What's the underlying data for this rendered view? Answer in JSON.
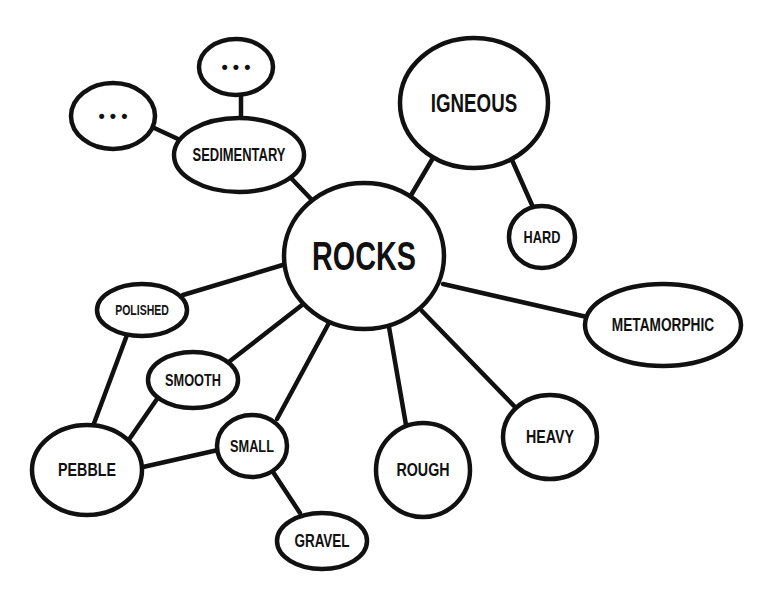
{
  "diagram": {
    "type": "mind-map",
    "colors": {
      "stroke": "#111111",
      "fill": "#ffffff",
      "text": "#111111"
    },
    "nodes": [
      {
        "id": "rocks",
        "label": "ROCKS",
        "cx": 364,
        "cy": 256,
        "rx": 80,
        "ry": 73,
        "font": 40,
        "scaleX": 0.72
      },
      {
        "id": "igneous",
        "label": "IGNEOUS",
        "cx": 474,
        "cy": 103,
        "rx": 74,
        "ry": 65,
        "font": 26,
        "scaleX": 0.72
      },
      {
        "id": "hard",
        "label": "HARD",
        "cx": 542,
        "cy": 237,
        "rx": 33,
        "ry": 31,
        "font": 17,
        "scaleX": 0.75
      },
      {
        "id": "sedimentary",
        "label": "SEDIMENTARY",
        "cx": 239,
        "cy": 155,
        "rx": 65,
        "ry": 37,
        "font": 18,
        "scaleX": 0.72
      },
      {
        "id": "dots-top",
        "label": "• • •",
        "cx": 236,
        "cy": 67,
        "rx": 37,
        "ry": 28,
        "font": 18,
        "scaleX": 1
      },
      {
        "id": "dots-left",
        "label": "• • •",
        "cx": 113,
        "cy": 116,
        "rx": 42,
        "ry": 33,
        "font": 18,
        "scaleX": 1
      },
      {
        "id": "metamorphic",
        "label": "METAMORPHIC",
        "cx": 663,
        "cy": 325,
        "rx": 78,
        "ry": 41,
        "font": 19,
        "scaleX": 0.72
      },
      {
        "id": "heavy",
        "label": "HEAVY",
        "cx": 550,
        "cy": 437,
        "rx": 47,
        "ry": 42,
        "font": 19,
        "scaleX": 0.75
      },
      {
        "id": "rough",
        "label": "ROUGH",
        "cx": 423,
        "cy": 470,
        "rx": 47,
        "ry": 47,
        "font": 19,
        "scaleX": 0.75
      },
      {
        "id": "polished",
        "label": "POLISHED",
        "cx": 142,
        "cy": 310,
        "rx": 45,
        "ry": 26,
        "font": 14,
        "scaleX": 0.75
      },
      {
        "id": "smooth",
        "label": "SMOOTH",
        "cx": 193,
        "cy": 380,
        "rx": 45,
        "ry": 28,
        "font": 17,
        "scaleX": 0.75
      },
      {
        "id": "small",
        "label": "SMALL",
        "cx": 252,
        "cy": 446,
        "rx": 35,
        "ry": 31,
        "font": 17,
        "scaleX": 0.75
      },
      {
        "id": "pebble",
        "label": "PEBBLE",
        "cx": 87,
        "cy": 470,
        "rx": 55,
        "ry": 45,
        "font": 19,
        "scaleX": 0.75
      },
      {
        "id": "gravel",
        "label": "GRAVEL",
        "cx": 322,
        "cy": 541,
        "rx": 45,
        "ry": 28,
        "font": 18,
        "scaleX": 0.75
      }
    ],
    "edges": [
      {
        "from": "rocks",
        "to": "igneous",
        "x1": 410,
        "y1": 197,
        "x2": 433,
        "y2": 158
      },
      {
        "from": "igneous",
        "to": "hard",
        "x1": 512,
        "y1": 160,
        "x2": 532,
        "y2": 205
      },
      {
        "from": "rocks",
        "to": "sedimentary",
        "x1": 312,
        "y1": 200,
        "x2": 290,
        "y2": 177
      },
      {
        "from": "sedimentary",
        "to": "dots-top",
        "x1": 241,
        "y1": 118,
        "x2": 241,
        "y2": 94
      },
      {
        "from": "sedimentary",
        "to": "dots-left",
        "x1": 178,
        "y1": 139,
        "x2": 150,
        "y2": 126
      },
      {
        "from": "rocks",
        "to": "metamorphic",
        "x1": 443,
        "y1": 284,
        "x2": 587,
        "y2": 317
      },
      {
        "from": "rocks",
        "to": "heavy",
        "x1": 422,
        "y1": 311,
        "x2": 516,
        "y2": 408
      },
      {
        "from": "rocks",
        "to": "rough",
        "x1": 389,
        "y1": 327,
        "x2": 406,
        "y2": 425
      },
      {
        "from": "rocks",
        "to": "polished",
        "x1": 286,
        "y1": 264,
        "x2": 183,
        "y2": 295
      },
      {
        "from": "rocks",
        "to": "smooth",
        "x1": 302,
        "y1": 305,
        "x2": 230,
        "y2": 361
      },
      {
        "from": "rocks",
        "to": "small",
        "x1": 330,
        "y1": 321,
        "x2": 277,
        "y2": 419
      },
      {
        "from": "polished",
        "to": "pebble",
        "x1": 127,
        "y1": 335,
        "x2": 93,
        "y2": 426
      },
      {
        "from": "smooth",
        "to": "pebble",
        "x1": 157,
        "y1": 399,
        "x2": 128,
        "y2": 441
      },
      {
        "from": "small",
        "to": "pebble",
        "x1": 218,
        "y1": 450,
        "x2": 143,
        "y2": 467
      },
      {
        "from": "small",
        "to": "gravel",
        "x1": 273,
        "y1": 472,
        "x2": 300,
        "y2": 513
      }
    ]
  }
}
